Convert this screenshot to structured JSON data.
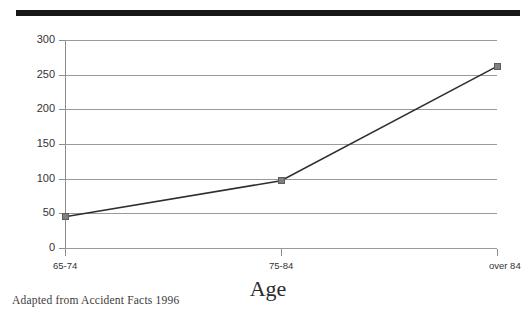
{
  "document": {
    "source_note": "Adapted from Accident Facts 1996",
    "top_rule": "horizontal-rule"
  },
  "chart_data": {
    "type": "line",
    "title": "",
    "xlabel": "Age",
    "ylabel": "",
    "categories": [
      "65-74",
      "75-84",
      "over 84"
    ],
    "values": [
      45,
      97,
      262
    ],
    "series": [
      {
        "name": "",
        "values": [
          45,
          97,
          262
        ]
      }
    ],
    "ylim": [
      0,
      300
    ],
    "ytick_labels": [
      "300",
      "250",
      "200",
      "150",
      "100",
      "50",
      "0"
    ],
    "ytick_values": [
      300,
      250,
      200,
      150,
      100,
      50,
      0
    ],
    "grid": true,
    "legend": "none",
    "line_color": "#2e2e2e",
    "marker_color": "#808080",
    "gridline_color": "#9a9a9a",
    "axis_color": "#8c8c8c"
  }
}
